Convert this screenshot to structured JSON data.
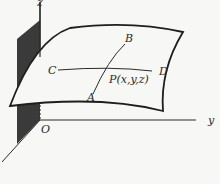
{
  "diagram": {
    "axes": {
      "z": "z",
      "y": "y",
      "origin": "O"
    },
    "points": {
      "A": "A",
      "B": "B",
      "C": "C",
      "D": "D",
      "P": "P(x,y,z)"
    },
    "colors": {
      "line": "#2a2a2a",
      "plane": "#3a3a3a",
      "background": "#f7f7f5"
    }
  }
}
